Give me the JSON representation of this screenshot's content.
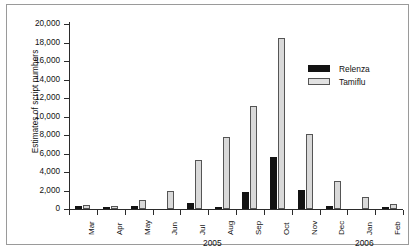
{
  "chart_data": {
    "type": "bar",
    "title": "",
    "xlabel": "",
    "ylabel": "Estimates of script numbers",
    "ylim": [
      0,
      20000
    ],
    "ytick_labels": [
      "20,000",
      "18,000",
      "16,000",
      "14,000",
      "12,000",
      "10,000",
      "8,000",
      "6,000",
      "4,000",
      "2,000",
      "0"
    ],
    "ytick_values": [
      20000,
      18000,
      16000,
      14000,
      12000,
      10000,
      8000,
      6000,
      4000,
      2000,
      0
    ],
    "grid": false,
    "legend_position": "top-right",
    "categories": [
      "Mar",
      "Apr",
      "May",
      "Jun",
      "Jul",
      "Aug",
      "Sep",
      "Oct",
      "Nov",
      "Dec",
      "Jan",
      "Feb"
    ],
    "group_labels": [
      {
        "text": "2005",
        "spans": "Mar-Dec"
      },
      {
        "text": "2006",
        "spans": "Jan-Feb"
      }
    ],
    "series": [
      {
        "name": "Relenza",
        "color": "#131313",
        "values": [
          300,
          200,
          350,
          0,
          700,
          250,
          1850,
          5650,
          2100,
          300,
          0,
          200
        ]
      },
      {
        "name": "Tamiflu",
        "color": "#d9d9d9",
        "values": [
          400,
          300,
          950,
          2000,
          5300,
          7800,
          11100,
          18500,
          8150,
          3050,
          1300,
          550
        ]
      }
    ]
  }
}
